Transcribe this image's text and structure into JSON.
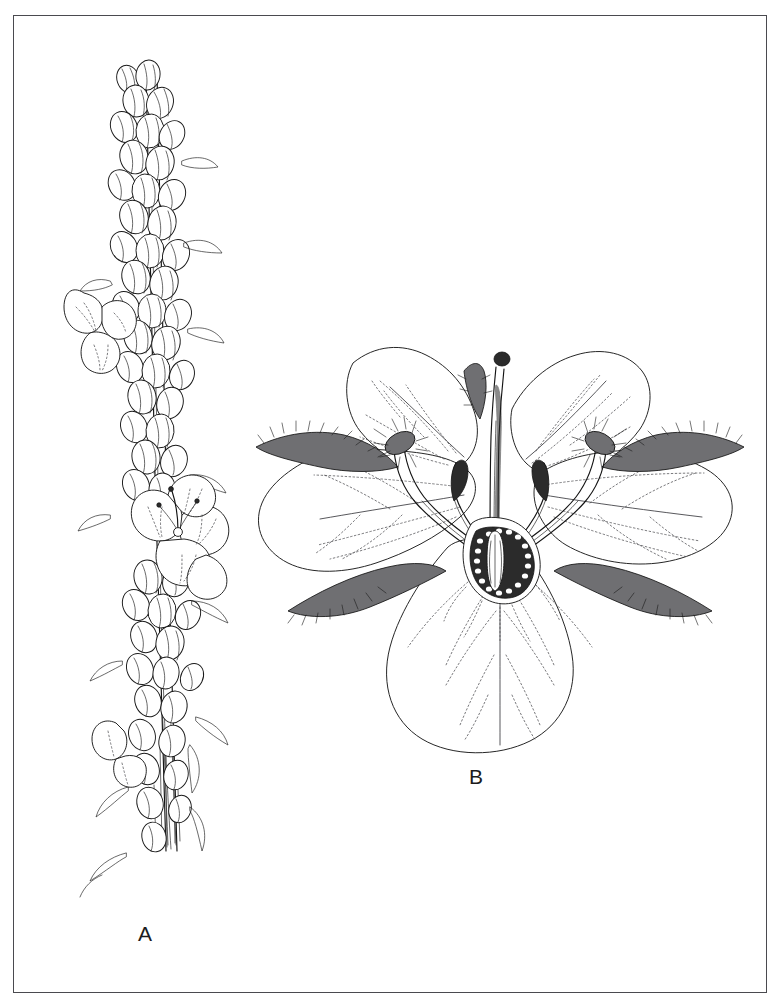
{
  "plate": {
    "background_color": "#ffffff",
    "border_color": "#4a4a4f",
    "ink_color": "#1a1a1a",
    "medium": "pen-and-ink line drawing",
    "figures": [
      {
        "key": "a",
        "label": "A",
        "subject": "flowering spike",
        "description": "elongate terminal raceme bearing dense overlapping flower buds, a few expanded flowers and narrow bracts along a striate stem"
      },
      {
        "key": "b",
        "label": "B",
        "subject": "single flower, face view",
        "description": "enlarged five-petalled flower with spreading rounded petals, dark bristly sepals, four arching stamens, central style with capitate stigma and a toothed nectary disc around the ovary"
      }
    ]
  }
}
